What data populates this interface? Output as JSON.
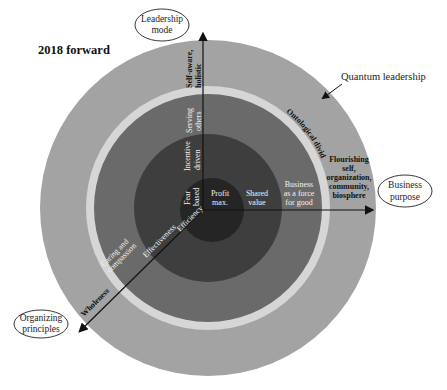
{
  "title": "2018 forward",
  "axes": {
    "vertical": {
      "label": "Leadership mode",
      "label_lines": [
        "Leadership",
        "mode"
      ]
    },
    "horizontal": {
      "label": "Business purpose",
      "label_lines": [
        "Business",
        "purpose"
      ]
    },
    "diagonal": {
      "label": "Organizing principles",
      "label_lines": [
        "Organizing",
        "principles"
      ]
    }
  },
  "callouts": {
    "outer_ring": "Quantum leadership",
    "divide": "Ontological divide"
  },
  "rings": [
    {
      "name": "core",
      "color": "#2a2a2a",
      "leadership_mode": [
        "Fear",
        "based"
      ],
      "business_purpose": [
        "Profit",
        "max."
      ],
      "organizing_principle": "Efficiency"
    },
    {
      "name": "second",
      "color": "#3e3e3e",
      "leadership_mode": [
        "Incentive",
        "driven"
      ],
      "business_purpose": [
        "Shared",
        "value"
      ],
      "organizing_principle": "Effectiveness"
    },
    {
      "name": "third",
      "color": "#6a6a6a",
      "leadership_mode": [
        "Serving",
        "others"
      ],
      "business_purpose": [
        "Business",
        "as a force",
        "for good"
      ],
      "organizing_principle": [
        "Caring and",
        "compassion"
      ]
    },
    {
      "name": "divide",
      "color": "#d6d6d6"
    },
    {
      "name": "outer",
      "color": "#a3a3a3",
      "leadership_mode": [
        "Self-aware,",
        "holistic"
      ],
      "business_purpose": [
        "Flourishing",
        "self,",
        "organization,",
        "community,",
        "biosphere"
      ],
      "organizing_principle": "Wholeness"
    }
  ]
}
